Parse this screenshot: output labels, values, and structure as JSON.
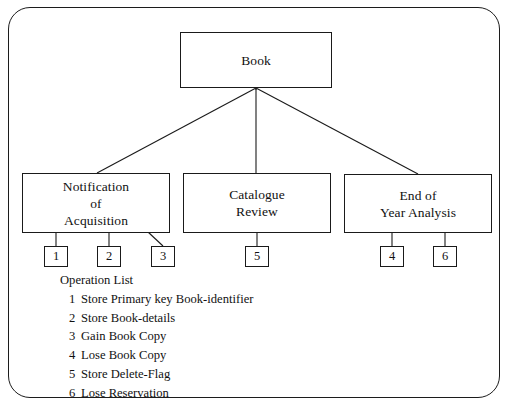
{
  "diagram": {
    "title": "Book",
    "root": {
      "label": "Book",
      "lines": [
        "Book"
      ]
    },
    "children": [
      {
        "id": "notification-of-acquisition",
        "lines": [
          "Notification",
          "of",
          "Acquisition"
        ]
      },
      {
        "id": "catalogue-review",
        "lines": [
          "Catalogue",
          "Review"
        ]
      },
      {
        "id": "end-of-year-analysis",
        "lines": [
          "End of",
          "Year Analysis"
        ]
      }
    ],
    "operation_boxes": [
      {
        "number": "1"
      },
      {
        "number": "2"
      },
      {
        "number": "3"
      },
      {
        "number": "5"
      },
      {
        "number": "4"
      },
      {
        "number": "6"
      }
    ],
    "legend": {
      "title": "Operation List",
      "items": [
        {
          "number": "1",
          "text": "Store Primary key Book-identifier"
        },
        {
          "number": "2",
          "text": "Store Book-details"
        },
        {
          "number": "3",
          "text": "Gain Book Copy"
        },
        {
          "number": "4",
          "text": "Lose Book Copy"
        },
        {
          "number": "5",
          "text": "Store Delete-Flag"
        },
        {
          "number": "6",
          "text": "Lose Reservation"
        }
      ]
    },
    "colors": {
      "stroke": "#1a1a1a",
      "text": "#111111",
      "background": "#ffffff"
    }
  }
}
